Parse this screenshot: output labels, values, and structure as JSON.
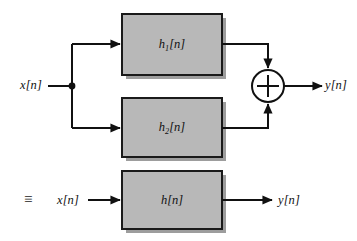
{
  "figure": {
    "type": "block-diagram",
    "background_color": "#ffffff",
    "block_fill_color": "#b8b8b8",
    "block_border_color": "#1a1a1a",
    "wire_color": "#111111",
    "shadow_color": "#9a9a9a"
  },
  "top_diagram": {
    "input_label": "x[n]",
    "output_label": "y[n]",
    "branch_node": "branch-dot",
    "summing_junction": {
      "symbol": "+",
      "name": "summing-junction",
      "inputs": 2
    },
    "blocks": [
      {
        "label_base": "h",
        "label_sub": "1",
        "label_tail": "[n]",
        "name": "block-h1"
      },
      {
        "label_base": "h",
        "label_sub": "2",
        "label_tail": "[n]",
        "name": "block-h2"
      }
    ]
  },
  "equivalence": {
    "symbol": "≡"
  },
  "bottom_diagram": {
    "input_label": "x[n]",
    "output_label": "y[n]",
    "block": {
      "label_base": "h",
      "label_sub": "",
      "label_tail": "[n]",
      "name": "block-h"
    }
  }
}
